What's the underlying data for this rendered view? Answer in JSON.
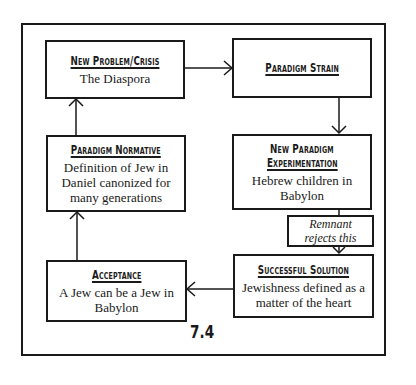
{
  "figure_label": "7.4",
  "nodes": {
    "new_problem": {
      "title": "New Problem/Crisis",
      "body": "The Diaspora"
    },
    "paradigm_strain": {
      "title": "Paradigm Strain",
      "body": ""
    },
    "experimentation": {
      "title_line1": "New Paradigm",
      "title_line2": "Experimentation",
      "body": "Hebrew children in Babylon"
    },
    "remnant": {
      "line1": "Remnant",
      "line2": "rejects this"
    },
    "successful_solution": {
      "title": "Successful Solution",
      "body_line1": "Jewishness defined as a",
      "body_line2": "matter of the heart"
    },
    "acceptance": {
      "title": "Acceptance",
      "body_line1": "A Jew can be a Jew in",
      "body_line2": "Babylon"
    },
    "paradigm_normative": {
      "title": "Paradigm Normative",
      "body_line1": "Definition of Jew in",
      "body_line2": "Daniel canonized for",
      "body_line3": "many generations"
    }
  },
  "flow": [
    "New Problem/Crisis -> Paradigm Strain",
    "Paradigm Strain -> New Paradigm Experimentation",
    "New Paradigm Experimentation -> Remnant rejects this -> Successful Solution",
    "Successful Solution -> Acceptance",
    "Acceptance -> Paradigm Normative",
    "Paradigm Normative -> New Problem/Crisis"
  ]
}
